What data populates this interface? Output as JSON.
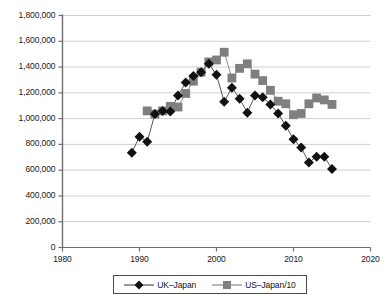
{
  "chart_data": {
    "type": "line",
    "title": "",
    "subtitle": "",
    "xlabel": "",
    "ylabel": "",
    "xlim": [
      1980,
      2020
    ],
    "ylim": [
      0,
      1800000
    ],
    "xticks": [
      1980,
      1990,
      2000,
      2010,
      2020
    ],
    "xtick_labels": [
      "1980",
      "1990",
      "2000",
      "2010",
      "2020"
    ],
    "yticks": [
      0,
      200000,
      400000,
      600000,
      800000,
      1000000,
      1200000,
      1400000,
      1600000,
      1800000
    ],
    "ytick_labels": [
      "0",
      "200,000",
      "400,000",
      "600,000",
      "800,000",
      "1,000,000",
      "1,200,000",
      "1,400,000",
      "1,600,000",
      "1,800,000"
    ],
    "grid": "horizontal",
    "legend_position": "bottom",
    "series": [
      {
        "name": "UK–Japan",
        "marker": "diamond",
        "color": "#111111",
        "line_color": "#555555",
        "x": [
          1989,
          1990,
          1991,
          1992,
          1993,
          1994,
          1995,
          1996,
          1997,
          1998,
          1999,
          2000,
          2001,
          2002,
          2003,
          2004,
          2005,
          2006,
          2007,
          2008,
          2009,
          2010,
          2011,
          2012,
          2013,
          2014,
          2015
        ],
        "values": [
          735000,
          860000,
          820000,
          1035000,
          1060000,
          1055000,
          1180000,
          1280000,
          1330000,
          1360000,
          1425000,
          1340000,
          1130000,
          1240000,
          1155000,
          1045000,
          1180000,
          1165000,
          1110000,
          1040000,
          945000,
          840000,
          775000,
          660000,
          705000,
          705000,
          610000
        ]
      },
      {
        "name": "US–Japan/10",
        "marker": "square",
        "color": "#7f7f7f",
        "line_color": "#8c8c8c",
        "x": [
          1991,
          1992,
          1993,
          1994,
          1995,
          1996,
          1997,
          1998,
          1999,
          2000,
          2001,
          2002,
          2003,
          2004,
          2005,
          2006,
          2007,
          2008,
          2009,
          2010,
          2011,
          2012,
          2013,
          2014,
          2015
        ],
        "values": [
          1060000,
          1035000,
          1060000,
          1095000,
          1090000,
          1195000,
          1290000,
          1360000,
          1440000,
          1455000,
          1515000,
          1315000,
          1390000,
          1425000,
          1345000,
          1295000,
          1220000,
          1135000,
          1115000,
          1030000,
          1040000,
          1115000,
          1160000,
          1145000,
          1110000
        ]
      }
    ]
  },
  "legend": {
    "items": [
      {
        "label": "UK–Japan",
        "marker": "diamond"
      },
      {
        "label": "US–Japan/10",
        "marker": "square"
      }
    ]
  },
  "colors": {
    "series_uk": "#111111",
    "series_us": "#7f7f7f",
    "axis": "#6e6e6e",
    "grid": "#cfcfcf",
    "text": "#1a1a1a"
  }
}
